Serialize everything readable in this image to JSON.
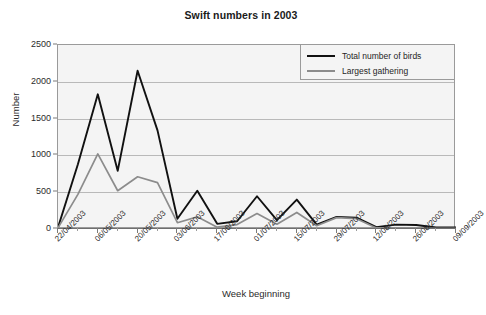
{
  "chart_data": {
    "type": "line",
    "title": "Swift numbers in 2003",
    "xlabel": "Week beginning",
    "ylabel": "Number",
    "ylim": [
      0,
      2500
    ],
    "yticks": [
      0,
      500,
      1000,
      1500,
      2000,
      2500
    ],
    "grid": true,
    "legend_position": "top-right",
    "x_tick_labels": [
      "22/04/2003",
      "06/05/2003",
      "20/05/2003",
      "03/06/2003",
      "17/06/2003",
      "01/07/2003",
      "15/07/2003",
      "29/07/2003",
      "12/08/2003",
      "26/08/2003",
      "09/09/2003"
    ],
    "x": [
      "22/04/2003",
      "29/04/2003",
      "06/05/2003",
      "13/05/2003",
      "20/05/2003",
      "27/05/2003",
      "03/06/2003",
      "10/06/2003",
      "17/06/2003",
      "24/06/2003",
      "01/07/2003",
      "08/07/2003",
      "15/07/2003",
      "22/07/2003",
      "29/07/2003",
      "05/08/2003",
      "12/08/2003",
      "19/08/2003",
      "26/08/2003",
      "02/09/2003",
      "09/09/2003"
    ],
    "series": [
      {
        "name": "Total number of birds",
        "color": "#111111",
        "values": [
          20,
          880,
          1830,
          790,
          2150,
          1340,
          140,
          520,
          70,
          105,
          445,
          120,
          400,
          60,
          165,
          155,
          25,
          60,
          55,
          20,
          20
        ]
      },
      {
        "name": "Largest gathering",
        "color": "#8c8c8c",
        "values": [
          15,
          470,
          1020,
          520,
          710,
          630,
          85,
          165,
          25,
          60,
          210,
          65,
          225,
          45,
          155,
          140,
          15,
          15,
          12,
          10,
          10
        ]
      }
    ]
  },
  "legend": {
    "items": [
      {
        "label": "Total number of birds"
      },
      {
        "label": "Largest gathering"
      }
    ]
  },
  "colors": {
    "series_total": "#111111",
    "series_largest": "#8c8c8c",
    "plot_background": "#f4f4f4",
    "gridline": "#b9b9b9",
    "axis": "#6e6e6e"
  }
}
